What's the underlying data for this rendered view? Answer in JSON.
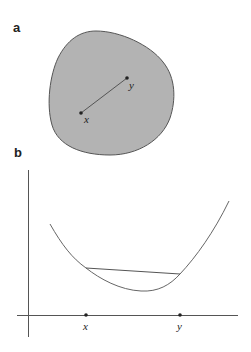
{
  "panels": [
    {
      "label": "a",
      "description": "convex set with segment between two points",
      "points": [
        {
          "name": "x",
          "label": "x"
        },
        {
          "name": "y",
          "label": "y"
        }
      ],
      "colors": {
        "fill": "#b3b3b3",
        "stroke": "#555555",
        "segment": "#555555"
      }
    },
    {
      "label": "b",
      "description": "convex function with chord between x and y",
      "ticks": [
        {
          "name": "x",
          "label": "x"
        },
        {
          "name": "y",
          "label": "y"
        }
      ],
      "colors": {
        "curve": "#666666",
        "axis": "#555555",
        "chord": "#555555"
      }
    }
  ]
}
